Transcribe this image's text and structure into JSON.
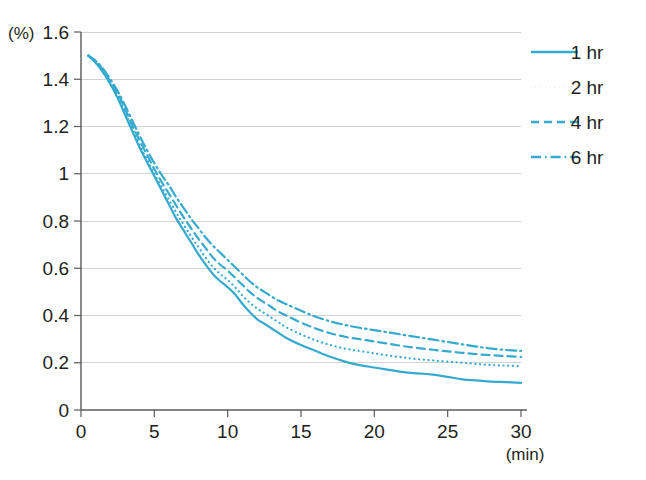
{
  "chart_data": {
    "type": "line",
    "title": "",
    "subtitle": "",
    "xlabel": "(min)",
    "ylabel": "(%)",
    "xlim": [
      0,
      30
    ],
    "ylim": [
      0,
      1.6
    ],
    "grid": true,
    "grid_axis": "y",
    "legend_position": "top-right",
    "x_ticks": [
      0,
      5,
      10,
      15,
      20,
      25,
      30
    ],
    "x_tick_labels": [
      "0",
      "5",
      "10",
      "15",
      "20",
      "25",
      "30"
    ],
    "y_ticks": [
      0,
      0.2,
      0.4,
      0.6,
      0.8,
      1.0,
      1.2,
      1.4,
      1.6
    ],
    "y_tick_labels": [
      "0",
      "0.2",
      "0.4",
      "0.6",
      "0.8",
      "1",
      "1.2",
      "1.4",
      "1.6"
    ],
    "series": [
      {
        "name": "1 hr",
        "style": "solid",
        "color": "#35aace",
        "x": [
          0.5,
          1,
          1.5,
          2,
          2.5,
          3,
          3.5,
          4,
          4.5,
          5,
          5.5,
          6,
          6.5,
          7,
          7.5,
          8,
          8.5,
          9,
          9.5,
          10,
          10.5,
          11,
          11.5,
          12,
          12.5,
          13,
          13.5,
          14,
          15,
          16,
          17,
          18,
          19,
          20,
          21,
          22,
          23,
          24,
          25,
          26,
          27,
          28,
          29,
          30
        ],
        "values": [
          1.5,
          1.47,
          1.43,
          1.38,
          1.32,
          1.25,
          1.18,
          1.11,
          1.05,
          0.99,
          0.93,
          0.87,
          0.81,
          0.76,
          0.71,
          0.66,
          0.615,
          0.575,
          0.545,
          0.52,
          0.49,
          0.45,
          0.415,
          0.385,
          0.365,
          0.345,
          0.325,
          0.305,
          0.275,
          0.25,
          0.225,
          0.205,
          0.19,
          0.18,
          0.17,
          0.16,
          0.155,
          0.15,
          0.14,
          0.13,
          0.125,
          0.12,
          0.118,
          0.115
        ]
      },
      {
        "name": "2 hr",
        "style": "dotted",
        "color": "#35aace",
        "x": [
          0.5,
          1,
          1.5,
          2,
          2.5,
          3,
          3.5,
          4,
          4.5,
          5,
          5.5,
          6,
          6.5,
          7,
          7.5,
          8,
          8.5,
          9,
          9.5,
          10,
          10.5,
          11,
          11.5,
          12,
          12.5,
          13,
          13.5,
          14,
          15,
          16,
          17,
          18,
          19,
          20,
          21,
          22,
          23,
          24,
          25,
          26,
          27,
          28,
          29,
          30
        ],
        "values": [
          1.5,
          1.47,
          1.43,
          1.38,
          1.33,
          1.26,
          1.19,
          1.12,
          1.06,
          1.0,
          0.945,
          0.89,
          0.835,
          0.785,
          0.735,
          0.69,
          0.645,
          0.605,
          0.575,
          0.55,
          0.52,
          0.485,
          0.455,
          0.43,
          0.41,
          0.39,
          0.37,
          0.35,
          0.32,
          0.295,
          0.275,
          0.26,
          0.25,
          0.24,
          0.23,
          0.222,
          0.215,
          0.21,
          0.205,
          0.2,
          0.195,
          0.19,
          0.188,
          0.185
        ]
      },
      {
        "name": "4 hr",
        "style": "dashed",
        "color": "#35aace",
        "x": [
          0.5,
          1,
          1.5,
          2,
          2.5,
          3,
          3.5,
          4,
          4.5,
          5,
          5.5,
          6,
          6.5,
          7,
          7.5,
          8,
          8.5,
          9,
          9.5,
          10,
          10.5,
          11,
          11.5,
          12,
          12.5,
          13,
          13.5,
          14,
          15,
          16,
          17,
          18,
          19,
          20,
          21,
          22,
          23,
          24,
          25,
          26,
          27,
          28,
          29,
          30
        ],
        "values": [
          1.5,
          1.475,
          1.44,
          1.39,
          1.34,
          1.275,
          1.205,
          1.14,
          1.08,
          1.02,
          0.965,
          0.915,
          0.865,
          0.815,
          0.77,
          0.725,
          0.685,
          0.645,
          0.615,
          0.59,
          0.56,
          0.53,
          0.5,
          0.475,
          0.455,
          0.435,
          0.415,
          0.4,
          0.37,
          0.345,
          0.325,
          0.31,
          0.3,
          0.29,
          0.28,
          0.27,
          0.262,
          0.255,
          0.248,
          0.242,
          0.236,
          0.232,
          0.228,
          0.225
        ]
      },
      {
        "name": "6 hr",
        "style": "dashdot",
        "color": "#35aace",
        "x": [
          0.5,
          1,
          1.5,
          2,
          2.5,
          3,
          3.5,
          4,
          4.5,
          5,
          5.5,
          6,
          6.5,
          7,
          7.5,
          8,
          8.5,
          9,
          9.5,
          10,
          10.5,
          11,
          11.5,
          12,
          12.5,
          13,
          13.5,
          14,
          15,
          16,
          17,
          18,
          19,
          20,
          21,
          22,
          23,
          24,
          25,
          26,
          27,
          28,
          29,
          30
        ],
        "values": [
          1.5,
          1.478,
          1.445,
          1.4,
          1.35,
          1.29,
          1.225,
          1.16,
          1.1,
          1.045,
          0.995,
          0.95,
          0.9,
          0.855,
          0.81,
          0.77,
          0.73,
          0.695,
          0.665,
          0.635,
          0.605,
          0.575,
          0.545,
          0.52,
          0.5,
          0.48,
          0.462,
          0.448,
          0.42,
          0.395,
          0.375,
          0.36,
          0.348,
          0.338,
          0.328,
          0.318,
          0.308,
          0.298,
          0.288,
          0.278,
          0.268,
          0.26,
          0.254,
          0.25
        ]
      }
    ]
  },
  "legend": {
    "items": [
      {
        "label": "1 hr"
      },
      {
        "label": "2 hr"
      },
      {
        "label": "4 hr"
      },
      {
        "label": "6 hr"
      }
    ]
  },
  "colors": {
    "series": "#35aace",
    "grid": "#d2d2d2",
    "axis": "#5b5b5b",
    "text": "#231f20",
    "background": "#ffffff"
  }
}
